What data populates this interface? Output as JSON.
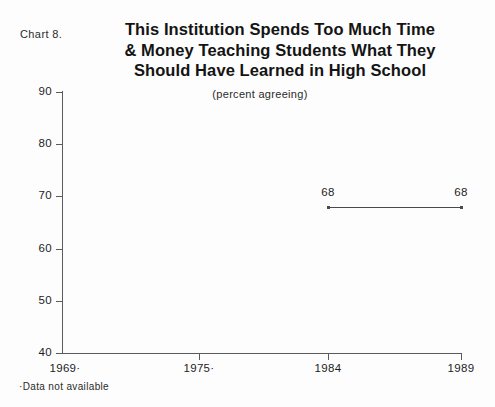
{
  "chart_label": "Chart 8.",
  "title_lines": [
    "This Institution Spends Too Much Time",
    "& Money Teaching Students What They",
    "Should Have Learned in High School"
  ],
  "subtitle": "(percent agreeing)",
  "footnote": "·Data not available",
  "colors": {
    "axis": "#5a5a5a",
    "series": "#4a4a4a",
    "text": "#1d1d1d",
    "background": "#fdfdfd"
  },
  "chart_data": {
    "type": "line",
    "title": "This Institution Spends Too Much Time & Money Teaching Students What They Should Have Learned in High School",
    "subtitle": "(percent agreeing)",
    "xlabel": "",
    "ylabel": "",
    "ylim": [
      40,
      90
    ],
    "yticks": [
      40,
      50,
      60,
      70,
      80,
      90
    ],
    "ytick_labels": [
      "40",
      "50",
      "60",
      "70",
      "80",
      "90"
    ],
    "categories": [
      "1969",
      "1975",
      "1984",
      "1989"
    ],
    "xtick_labels": [
      "1969·",
      "1975·",
      "1984",
      "1989"
    ],
    "values": [
      null,
      null,
      68,
      68
    ],
    "point_labels": [
      "",
      "",
      "68",
      "68"
    ],
    "grid": false,
    "legend": "none",
    "note": "Data not available for 1969 and 1975"
  }
}
